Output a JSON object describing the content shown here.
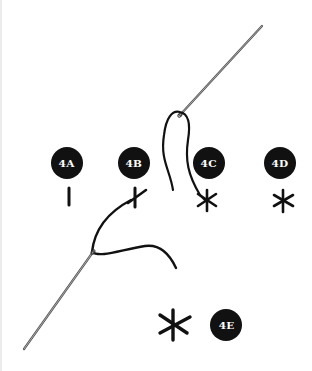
{
  "diagram": {
    "colors": {
      "background": "#ffffff",
      "ink": "#111111",
      "badge_text": "#ffffff",
      "needle": "#555555"
    },
    "steps": [
      {
        "id": "4A",
        "label": "4A",
        "stitch": "single vertical straight stitch"
      },
      {
        "id": "4B",
        "label": "4B",
        "stitch": "vertical stitch crossed by diagonal stitch"
      },
      {
        "id": "4C",
        "label": "4C",
        "stitch": "six-pointed star stitch with thread and needle loop"
      },
      {
        "id": "4D",
        "label": "4D",
        "stitch": "six-pointed star stitch"
      },
      {
        "id": "4E",
        "label": "4E",
        "stitch": "enlarged finished star stitch"
      }
    ]
  }
}
